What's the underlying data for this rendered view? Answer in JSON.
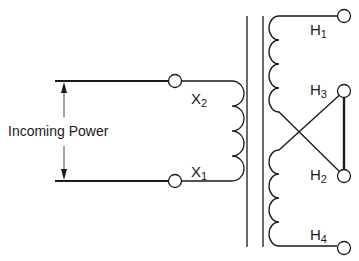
{
  "diagram": {
    "type": "transformer-wiring",
    "incoming_label": "Incoming Power",
    "terminals": {
      "x2": {
        "letter": "X",
        "sub": "2"
      },
      "x1": {
        "letter": "X",
        "sub": "1"
      },
      "h1": {
        "letter": "H",
        "sub": "1"
      },
      "h3": {
        "letter": "H",
        "sub": "3"
      },
      "h2": {
        "letter": "H",
        "sub": "2"
      },
      "h4": {
        "letter": "H",
        "sub": "4"
      }
    },
    "colors": {
      "line": "#1a1a1a",
      "background": "#ffffff"
    }
  }
}
